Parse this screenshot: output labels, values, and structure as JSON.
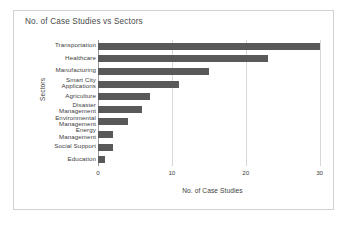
{
  "chart_data": {
    "type": "bar",
    "orientation": "horizontal",
    "title": "No. of Case Studies vs Sectors",
    "xlabel": "No. of Case Studies",
    "ylabel": "Sectors",
    "categories": [
      "Transportation",
      "Healthcare",
      "Manufacturing",
      "Smart City\nApplications",
      "Agriculture",
      "Disaster\nManagement",
      "Environmental\nManagement",
      "Energy\nManagement",
      "Social Support",
      "Education"
    ],
    "values": [
      30,
      23,
      15,
      11,
      7,
      6,
      4,
      2,
      2,
      1
    ],
    "xlim": [
      0,
      31
    ],
    "xticks": [
      0,
      10,
      20,
      30
    ],
    "xticklabels": [
      "0",
      "10",
      "20",
      "30"
    ],
    "grid": "vertical",
    "legend": "none",
    "bar_color": "#595959",
    "grid_color": "#d7d7d7",
    "axis_color": "#9a9a9a",
    "text_color": "#3d3d3d",
    "title_color": "#4a4a4a",
    "frame_color": "#d2d2d2",
    "background": "#ffffff"
  }
}
